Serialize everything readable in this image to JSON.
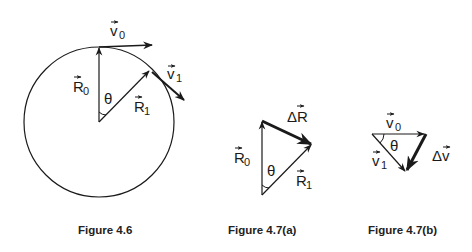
{
  "figures": [
    {
      "id": "fig-4-6",
      "caption": "Figure 4.6",
      "labels": {
        "v0": "v",
        "v0_sub": "0",
        "v1": "v",
        "v1_sub": "1",
        "R0": "R",
        "R0_sub": "0",
        "R1": "R",
        "R1_sub": "1",
        "theta": "θ"
      }
    },
    {
      "id": "fig-4-7a",
      "caption": "Figure  4.7(a)",
      "labels": {
        "deltaR": "ΔR",
        "R0": "R",
        "R0_sub": "0",
        "R1": "R",
        "R1_sub": "1",
        "theta": "θ"
      }
    },
    {
      "id": "fig-4-7b",
      "caption": "Figure  4.7(b)",
      "labels": {
        "v0": "v",
        "v0_sub": "0",
        "v1": "v",
        "v1_sub": "1",
        "deltav": "Δv",
        "theta": "θ"
      }
    }
  ],
  "colors": {
    "ink": "#1a1a1a",
    "background": "#ffffff"
  }
}
